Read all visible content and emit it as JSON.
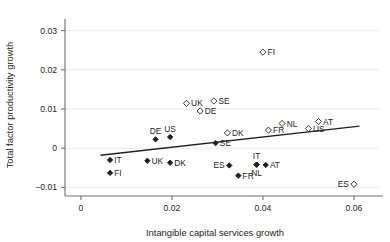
{
  "chart_data": {
    "type": "scatter",
    "title": "",
    "xlabel": "Intangible capital services growth",
    "ylabel": "Total factor productivity growth",
    "xlim": [
      -0.0035,
      0.0655
    ],
    "ylim": [
      -0.0122,
      0.0322
    ],
    "xticks": [
      0,
      0.02,
      0.04,
      0.06
    ],
    "xticklabels": [
      "0",
      "0.02",
      "0.04",
      "0.06"
    ],
    "yticks": [
      -0.01,
      0,
      0.01,
      0.02,
      0.03
    ],
    "yticklabels": [
      "−0.01",
      "0",
      "0.01",
      "0.02",
      "0.03"
    ],
    "grid": "horizontal-faint",
    "legend": "none",
    "series": [
      {
        "name": "open-diamond-series",
        "marker": "open-diamond",
        "points": [
          {
            "label": "FI",
            "x": 0.04,
            "y": 0.0245,
            "label_pos": "right"
          },
          {
            "label": "SE",
            "x": 0.0292,
            "y": 0.01205,
            "label_pos": "right"
          },
          {
            "label": "UK",
            "x": 0.0232,
            "y": 0.01145,
            "label_pos": "right"
          },
          {
            "label": "DE",
            "x": 0.0262,
            "y": 0.0095,
            "label_pos": "right"
          },
          {
            "label": "AT",
            "x": 0.0522,
            "y": 0.0068,
            "label_pos": "right"
          },
          {
            "label": "NL",
            "x": 0.0442,
            "y": 0.0063,
            "label_pos": "right"
          },
          {
            "label": "US",
            "x": 0.05,
            "y": 0.005,
            "label_pos": "right"
          },
          {
            "label": "FR",
            "x": 0.0412,
            "y": 0.0046,
            "label_pos": "right"
          },
          {
            "label": "DK",
            "x": 0.0322,
            "y": 0.0039,
            "label_pos": "right"
          },
          {
            "label": "ES",
            "x": 0.06,
            "y": -0.0092,
            "label_pos": "left"
          }
        ]
      },
      {
        "name": "filled-diamond-series",
        "marker": "filled-diamond",
        "points": [
          {
            "label": "US",
            "x": 0.0196,
            "y": 0.00285,
            "label_pos": "above"
          },
          {
            "label": "DE",
            "x": 0.0164,
            "y": 0.00225,
            "label_pos": "above"
          },
          {
            "label": "SE",
            "x": 0.0296,
            "y": 0.0013,
            "label_pos": "right"
          },
          {
            "label": "IT",
            "x": 0.0064,
            "y": -0.003,
            "label_pos": "right"
          },
          {
            "label": "UK",
            "x": 0.0146,
            "y": -0.0032,
            "label_pos": "right"
          },
          {
            "label": "DK",
            "x": 0.0196,
            "y": -0.0037,
            "label_pos": "right"
          },
          {
            "label": "IT",
            "x": 0.0386,
            "y": -0.0042,
            "label_pos": "above"
          },
          {
            "label": "NL",
            "x": 0.0386,
            "y": -0.0042,
            "label_pos": "below"
          },
          {
            "label": "AT",
            "x": 0.0406,
            "y": -0.0043,
            "label_pos": "right"
          },
          {
            "label": "ES",
            "x": 0.0326,
            "y": -0.0044,
            "label_pos": "left"
          },
          {
            "label": "FI",
            "x": 0.0064,
            "y": -0.0063,
            "label_pos": "right"
          },
          {
            "label": "FR",
            "x": 0.0346,
            "y": -0.007,
            "label_pos": "right"
          }
        ]
      }
    ],
    "trendline": {
      "name": "regression-line",
      "x_start": 0.0043,
      "y_start": -0.0018,
      "x_end": 0.0612,
      "y_end": 0.00565
    }
  }
}
